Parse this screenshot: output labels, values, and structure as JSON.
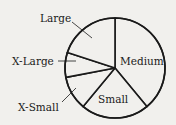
{
  "chart_data": {
    "type": "pie",
    "title": "",
    "categories": [
      "Medium",
      "Small",
      "X-Small",
      "X-Large",
      "Large"
    ],
    "values": [
      39,
      22,
      11,
      8,
      20
    ],
    "start_angle_deg": 0,
    "direction": "clockwise",
    "legend": "none",
    "label_placement": {
      "Medium": "inside",
      "Small": "inside",
      "X-Small": "outside-leader",
      "X-Large": "outside-leader",
      "Large": "outside-leader"
    }
  },
  "labels": {
    "medium": "Medium",
    "small": "Small",
    "xsmall": "X-Small",
    "xlarge": "X-Large",
    "large": "Large"
  },
  "colors": {
    "background": "#f1f0ed",
    "stroke": "#1a1a1a",
    "fill": "#f1f0ed"
  }
}
